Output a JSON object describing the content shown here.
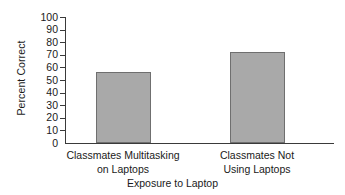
{
  "chart_data": {
    "type": "bar",
    "title": "",
    "xlabel": "Exposure to Laptop",
    "ylabel": "Percent Correct",
    "categories": [
      "Classmates Multitasking on Laptops",
      "Classmates Not Using Laptops"
    ],
    "category_lines": [
      [
        "Classmates Multitasking",
        "on Laptops"
      ],
      [
        "Classmates Not",
        "Using Laptops"
      ]
    ],
    "values": [
      56,
      72
    ],
    "ylim": [
      0,
      100
    ],
    "ytick_values": [
      100,
      90,
      80,
      70,
      60,
      50,
      40,
      30,
      20,
      10,
      0
    ],
    "ytick_labels": [
      "100",
      "90",
      "80",
      "70",
      "60",
      "50",
      "40",
      "30",
      "20",
      "10",
      "0"
    ],
    "grid": false,
    "legend": false,
    "bar_color": "#a9a9a9",
    "bar_edge_color": "#6f6f6f",
    "axis_color": "#3a3a3a",
    "background_color": "#ffffff"
  }
}
